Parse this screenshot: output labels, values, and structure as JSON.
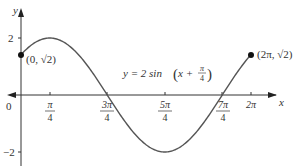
{
  "figure": {
    "equation_label": {
      "prefix": "y = 2 sin",
      "arg_prefix": "x + ",
      "frac_num": "π",
      "frac_den": "4"
    },
    "axes": {
      "x_label": "x",
      "y_label": "y",
      "origin_label": "0",
      "y_ticks": [
        {
          "label": "2",
          "value": 2
        },
        {
          "label": "−2",
          "value": -2
        }
      ],
      "x_ticks": [
        {
          "num": "π",
          "den": "4",
          "value_over_pi": 0.25
        },
        {
          "num": "3π",
          "den": "4",
          "value_over_pi": 0.75
        },
        {
          "num": "5π",
          "den": "4",
          "value_over_pi": 1.25
        },
        {
          "num": "7π",
          "den": "4",
          "value_over_pi": 1.75
        },
        {
          "label": "2π",
          "value_over_pi": 2
        }
      ]
    },
    "points": [
      {
        "label": "(0, √2)",
        "x_over_pi": 0,
        "y": 1.4142
      },
      {
        "label": "(2π, √2)",
        "x_over_pi": 2,
        "y": 1.4142
      }
    ],
    "colors": {
      "axis": "#333333",
      "curve": "#555555",
      "point": "#111111",
      "text": "#333333"
    }
  },
  "chart_data": {
    "type": "line",
    "title": "",
    "function": "y = 2 sin(x + π/4)",
    "xlabel": "x",
    "ylabel": "y",
    "x_ticks": [
      "π/4",
      "3π/4",
      "5π/4",
      "7π/4",
      "2π"
    ],
    "y_ticks": [
      "2",
      "−2"
    ],
    "xlim": [
      0,
      6.2832
    ],
    "ylim": [
      -2,
      2
    ],
    "series": [
      {
        "name": "y = 2 sin(x + π/4)",
        "x": [
          0,
          0.7854,
          1.5708,
          2.3562,
          3.1416,
          3.927,
          4.7124,
          5.4978,
          6.2832
        ],
        "values": [
          1.4142,
          2,
          1.4142,
          0,
          -1.4142,
          -2,
          -1.4142,
          0,
          1.4142
        ]
      }
    ],
    "annotations": [
      "(0, √2)",
      "(2π, √2)",
      "y = 2 sin(x + π/4)"
    ],
    "grid": false
  }
}
